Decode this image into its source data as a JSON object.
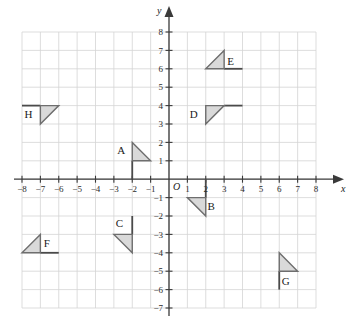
{
  "chart_data": {
    "type": "scatter",
    "title": "",
    "xlabel": "x",
    "ylabel": "y",
    "grid": true,
    "legend": "none",
    "xlim": [
      -8,
      8
    ],
    "ylim": [
      -7,
      8
    ],
    "origin_label": "O",
    "x_ticks": [
      "-8",
      "-7",
      "-6",
      "-5",
      "-4",
      "-3",
      "-2",
      "-1",
      "1",
      "2",
      "3",
      "4",
      "5",
      "6",
      "7",
      "8"
    ],
    "x_tick_values": [
      -8,
      -7,
      -6,
      -5,
      -4,
      -3,
      -2,
      -1,
      1,
      2,
      3,
      4,
      5,
      6,
      7,
      8
    ],
    "y_ticks": [
      "8",
      "7",
      "6",
      "5",
      "4",
      "3",
      "2",
      "1",
      "-1",
      "-2",
      "-3",
      "-4",
      "-5",
      "-6",
      "-7"
    ],
    "y_tick_values": [
      8,
      7,
      6,
      5,
      4,
      3,
      2,
      1,
      -1,
      -2,
      -3,
      -4,
      -5,
      -6,
      -7
    ],
    "shapes": [
      {
        "label": "A",
        "vertices": [
          [
            -2,
            2
          ],
          [
            -2,
            1
          ],
          [
            -1,
            1
          ]
        ],
        "label_pos": [
          -2.6,
          1.6
        ],
        "extra_segments": [
          [
            [
              -2,
              1
            ],
            [
              -2,
              0
            ]
          ]
        ]
      },
      {
        "label": "B",
        "vertices": [
          [
            1,
            -1
          ],
          [
            2,
            -1
          ],
          [
            2,
            -2
          ]
        ],
        "label_pos": [
          2.3,
          -1.45
        ],
        "extra_segments": [
          [
            [
              2,
              -1
            ],
            [
              2,
              0
            ]
          ]
        ]
      },
      {
        "label": "C",
        "vertices": [
          [
            -3,
            -3
          ],
          [
            -2,
            -3
          ],
          [
            -2,
            -4
          ]
        ],
        "label_pos": [
          -2.7,
          -2.4
        ],
        "extra_segments": [
          [
            [
              -2,
              -3
            ],
            [
              -2,
              -2
            ]
          ]
        ]
      },
      {
        "label": "D",
        "vertices": [
          [
            2,
            4
          ],
          [
            3,
            4
          ],
          [
            2,
            3
          ]
        ],
        "label_pos": [
          1.35,
          3.55
        ],
        "extra_segments": [
          [
            [
              3,
              4
            ],
            [
              4,
              4
            ]
          ]
        ]
      },
      {
        "label": "E",
        "vertices": [
          [
            2,
            6
          ],
          [
            3,
            6
          ],
          [
            3,
            7
          ]
        ],
        "label_pos": [
          3.35,
          6.45
        ],
        "extra_segments": [
          [
            [
              3,
              6
            ],
            [
              4,
              6
            ]
          ]
        ]
      },
      {
        "label": "F",
        "vertices": [
          [
            -8,
            -4
          ],
          [
            -7,
            -4
          ],
          [
            -7,
            -3
          ]
        ],
        "label_pos": [
          -6.65,
          -3.45
        ],
        "extra_segments": [
          [
            [
              -7,
              -4
            ],
            [
              -6,
              -4
            ]
          ]
        ]
      },
      {
        "label": "G",
        "vertices": [
          [
            6,
            -4
          ],
          [
            6,
            -5
          ],
          [
            7,
            -5
          ]
        ],
        "label_pos": [
          6.35,
          -5.55
        ],
        "extra_segments": [
          [
            [
              6,
              -5
            ],
            [
              6,
              -6
            ]
          ]
        ]
      },
      {
        "label": "H",
        "vertices": [
          [
            -7,
            4
          ],
          [
            -6,
            4
          ],
          [
            -7,
            3
          ]
        ],
        "label_pos": [
          -7.65,
          3.55
        ],
        "extra_segments": [
          [
            [
              -7,
              4
            ],
            [
              -8,
              4
            ]
          ]
        ]
      }
    ],
    "colors": {
      "shape_fill": "#d9d9d9",
      "shape_stroke": "#6e6e6e",
      "grid": "#d4d4d4",
      "axis": "#3a3a3a",
      "segment": "#4a4a4a",
      "text": "#1a1a1a"
    }
  }
}
